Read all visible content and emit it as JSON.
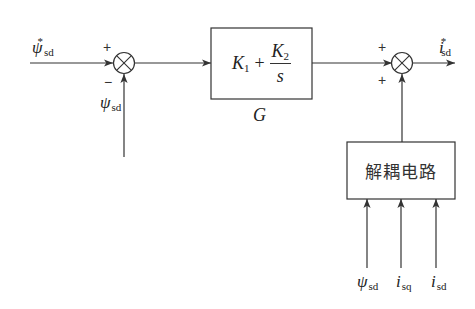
{
  "diagram": {
    "type": "control-block-diagram",
    "colors": {
      "line": "#333333",
      "background": "#ffffff",
      "text": "#222222"
    },
    "inputs": {
      "reference": {
        "symbol": "ψ",
        "subscript": "sd",
        "superscript": "*"
      },
      "feedback": {
        "symbol": "ψ",
        "subscript": "sd"
      }
    },
    "summing_junction_1": {
      "signs": {
        "top": "+",
        "bottom": "−"
      }
    },
    "controller_block": {
      "label": "G",
      "formula": {
        "k1": "K",
        "k1_sub": "1",
        "plus": "+",
        "k2": "K",
        "k2_sub": "2",
        "denominator": "s"
      }
    },
    "summing_junction_2": {
      "signs": {
        "top": "+",
        "bottom": "+"
      }
    },
    "output": {
      "symbol": "i",
      "subscript": "sd",
      "superscript": "*"
    },
    "decoupling_block": {
      "label": "解耦电路",
      "inputs": [
        {
          "symbol": "ψ",
          "subscript": "sd"
        },
        {
          "symbol": "i",
          "subscript": "sq"
        },
        {
          "symbol": "i",
          "subscript": "sd"
        }
      ]
    }
  }
}
